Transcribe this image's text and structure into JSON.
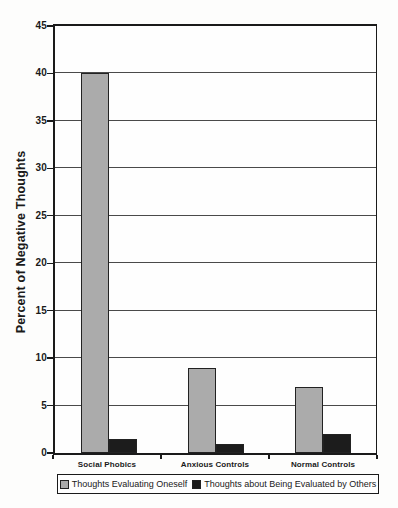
{
  "chart_data": {
    "type": "bar",
    "title": "",
    "categories": [
      "Social Phobics",
      "Anxious Controls",
      "Normal Controls"
    ],
    "series": [
      {
        "name": "Thoughts Evaluating Oneself",
        "color": "#ababab",
        "values": [
          40,
          9,
          7
        ]
      },
      {
        "name": "Thoughts about Being Evaluated by Others",
        "color": "#1c1c1c",
        "values": [
          1.5,
          1,
          2
        ]
      }
    ],
    "xlabel": "",
    "ylabel": "Percent of Negative Thoughts",
    "ylim": [
      0,
      45
    ],
    "yticks": [
      0,
      5,
      10,
      15,
      20,
      25,
      30,
      35,
      40,
      45
    ],
    "grid": true,
    "legend_position": "bottom"
  },
  "colors": {
    "frame": "#1a1a1a",
    "gridline": "#4a4a4a",
    "background": "#fdfdfc"
  }
}
